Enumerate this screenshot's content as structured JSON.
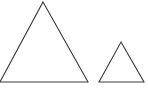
{
  "figure": {
    "background_color": "#ffffff",
    "width": 148,
    "height": 92,
    "stroke_color": "#3a3a3a",
    "stroke_width": 1.1,
    "fill": "none"
  },
  "chart_data": {
    "type": "diagram",
    "subtitle": "",
    "xlabel": "",
    "ylabel": "",
    "grid": false,
    "legend": false,
    "axis_visible": false,
    "units": "pixels",
    "xlim": [
      0,
      148
    ],
    "ylim": [
      0,
      92
    ],
    "shapes": [
      {
        "name": "large-triangle",
        "type": "triangle",
        "classification": "isosceles",
        "points": "43,2 88,82 0,82",
        "apex": [
          43,
          2
        ],
        "base_left": [
          0,
          82
        ],
        "base_right": [
          88,
          82
        ],
        "base_length": 88,
        "height": 80,
        "fill": "none",
        "stroke": "#3a3a3a",
        "stroke_width": 1.1
      },
      {
        "name": "small-triangle",
        "type": "triangle",
        "classification": "isosceles",
        "points": "121,42 144,82 99,82",
        "apex": [
          121,
          42
        ],
        "base_left": [
          99,
          82
        ],
        "base_right": [
          144,
          82
        ],
        "base_length": 45,
        "height": 40,
        "fill": "none",
        "stroke": "#3a3a3a",
        "stroke_width": 1.1
      }
    ],
    "relationship": "similar",
    "scale_ratio": "2:1",
    "annotations": [],
    "labels": []
  }
}
